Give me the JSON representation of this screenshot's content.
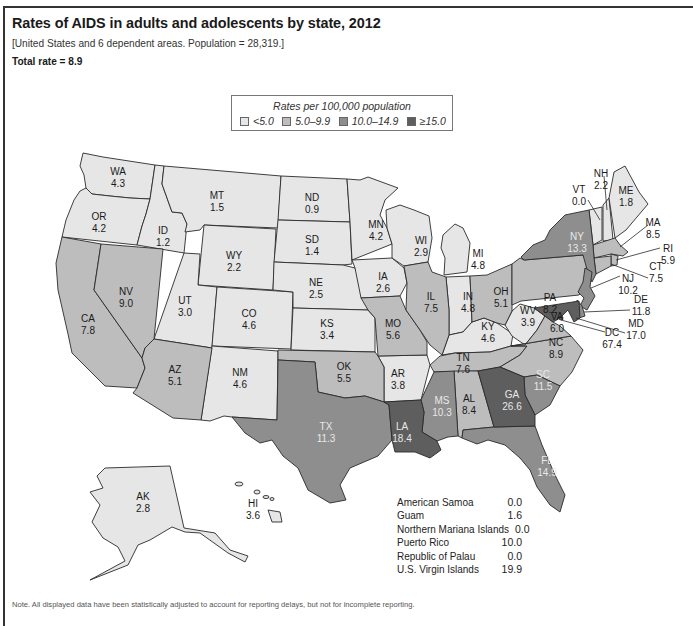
{
  "header": {
    "title": "Rates of AIDS in adults and adolescents by state, 2012",
    "subtitle": "[United States and 6 dependent areas. Population = 28,319.]",
    "total_rate": "Total rate = 8.9"
  },
  "legend": {
    "title": "Rates per 100,000 population",
    "items": [
      {
        "label": "<5.0",
        "color": "#e6e6e6"
      },
      {
        "label": "5.0–9.9",
        "color": "#bdbdbd"
      },
      {
        "label": "10.0–14.9",
        "color": "#8e8e8e"
      },
      {
        "label": "≥15.0",
        "color": "#5e5e5e"
      }
    ]
  },
  "colors": {
    "tier1": "#e6e6e6",
    "tier2": "#bdbdbd",
    "tier3": "#8e8e8e",
    "tier4": "#5e5e5e",
    "border": "#2a2a2a"
  },
  "states": {
    "WA": {
      "name": "WA",
      "value": "4.3"
    },
    "OR": {
      "name": "OR",
      "value": "4.2"
    },
    "CA": {
      "name": "CA",
      "value": "7.8"
    },
    "NV": {
      "name": "NV",
      "value": "9.0"
    },
    "ID": {
      "name": "ID",
      "value": "1.2"
    },
    "MT": {
      "name": "MT",
      "value": "1.5"
    },
    "WY": {
      "name": "WY",
      "value": "2.2"
    },
    "UT": {
      "name": "UT",
      "value": "3.0"
    },
    "AZ": {
      "name": "AZ",
      "value": "5.1"
    },
    "CO": {
      "name": "CO",
      "value": "4.6"
    },
    "NM": {
      "name": "NM",
      "value": "4.6"
    },
    "ND": {
      "name": "ND",
      "value": "0.9"
    },
    "SD": {
      "name": "SD",
      "value": "1.4"
    },
    "NE": {
      "name": "NE",
      "value": "2.5"
    },
    "KS": {
      "name": "KS",
      "value": "3.4"
    },
    "OK": {
      "name": "OK",
      "value": "5.5"
    },
    "TX": {
      "name": "TX",
      "value": "11.3"
    },
    "MN": {
      "name": "MN",
      "value": "4.2"
    },
    "IA": {
      "name": "IA",
      "value": "2.6"
    },
    "MO": {
      "name": "MO",
      "value": "5.6"
    },
    "AR": {
      "name": "AR",
      "value": "3.8"
    },
    "LA": {
      "name": "LA",
      "value": "18.4"
    },
    "WI": {
      "name": "WI",
      "value": "2.9"
    },
    "IL": {
      "name": "IL",
      "value": "7.5"
    },
    "MI": {
      "name": "MI",
      "value": "4.8"
    },
    "IN": {
      "name": "IN",
      "value": "4.8"
    },
    "OH": {
      "name": "OH",
      "value": "5.1"
    },
    "KY": {
      "name": "KY",
      "value": "4.6"
    },
    "TN": {
      "name": "TN",
      "value": "7.6"
    },
    "MS": {
      "name": "MS",
      "value": "10.3"
    },
    "AL": {
      "name": "AL",
      "value": "8.4"
    },
    "GA": {
      "name": "GA",
      "value": "26.6"
    },
    "FL": {
      "name": "FL",
      "value": "14.9"
    },
    "SC": {
      "name": "SC",
      "value": "11.5"
    },
    "NC": {
      "name": "NC",
      "value": "8.9"
    },
    "VA": {
      "name": "VA",
      "value": "6.0"
    },
    "WV": {
      "name": "WV",
      "value": "3.9"
    },
    "PA": {
      "name": "PA",
      "value": "8.2"
    },
    "NY": {
      "name": "NY",
      "value": "13.3"
    },
    "VT": {
      "name": "VT",
      "value": "0.0"
    },
    "NH": {
      "name": "NH",
      "value": "2.2"
    },
    "ME": {
      "name": "ME",
      "value": "1.8"
    },
    "MA": {
      "name": "MA",
      "value": "8.5"
    },
    "RI": {
      "name": "RI",
      "value": "5.9"
    },
    "CT": {
      "name": "CT",
      "value": "7.5"
    },
    "NJ": {
      "name": "NJ",
      "value": "10.2"
    },
    "DE": {
      "name": "DE",
      "value": "11.8"
    },
    "MD": {
      "name": "MD",
      "value": "17.0"
    },
    "DC": {
      "name": "DC",
      "value": "67.4"
    },
    "AK": {
      "name": "AK",
      "value": "2.8"
    },
    "HI": {
      "name": "HI",
      "value": "3.6"
    }
  },
  "territories": [
    {
      "name": "American Samoa",
      "value": "0.0"
    },
    {
      "name": "Guam",
      "value": "1.6"
    },
    {
      "name": "Northern Mariana Islands",
      "value": "0.0"
    },
    {
      "name": "Puerto Rico",
      "value": "10.0"
    },
    {
      "name": "Republic of Palau",
      "value": "0.0"
    },
    {
      "name": "U.S. Virgin Islands",
      "value": "19.9"
    }
  ],
  "footer": {
    "note": "Note. All displayed data have been statistically adjusted to account for reporting delays, but not for incomplete reporting."
  }
}
